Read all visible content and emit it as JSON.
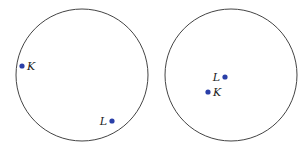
{
  "colors": {
    "circle": "#444444",
    "point": "#2a3fa8",
    "label": "#222222",
    "background": "#ffffff"
  },
  "figures": [
    {
      "name": "left",
      "circle": {
        "cx": 82,
        "cy": 75,
        "r": 66
      },
      "points": [
        {
          "label": "K",
          "x": 22,
          "y": 66,
          "lx": 27,
          "ly": 70,
          "anchor": "start"
        },
        {
          "label": "L",
          "x": 112,
          "y": 121,
          "lx": 107,
          "ly": 125,
          "anchor": "end"
        }
      ]
    },
    {
      "name": "right",
      "circle": {
        "cx": 231,
        "cy": 75,
        "r": 66
      },
      "points": [
        {
          "label": "L",
          "x": 225,
          "y": 77,
          "lx": 220,
          "ly": 81,
          "anchor": "end"
        },
        {
          "label": "K",
          "x": 208,
          "y": 92,
          "lx": 213,
          "ly": 96,
          "anchor": "start"
        }
      ]
    }
  ]
}
